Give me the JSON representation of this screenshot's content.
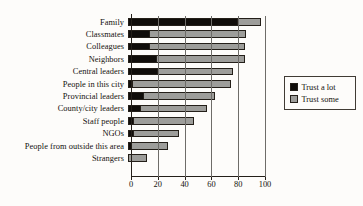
{
  "chart_data": {
    "type": "bar",
    "orientation": "horizontal",
    "stacked": true,
    "title": "",
    "xlabel": "",
    "ylabel": "",
    "xlim": [
      0,
      100
    ],
    "xticks": [
      0,
      20,
      40,
      60,
      80,
      100
    ],
    "grid": "vertical",
    "legend_position": "right",
    "categories": [
      "Family",
      "Classmates",
      "Colleagues",
      "Neighbors",
      "Central leaders",
      "People in this city",
      "Provincial leaders",
      "County/city leaders",
      "Staff people",
      "NGOs",
      "People from outside this area",
      "Strangers"
    ],
    "series": [
      {
        "name": "Trust a lot",
        "color": "#100d0a",
        "values": [
          81,
          16,
          16,
          21,
          22,
          3,
          11,
          9,
          4,
          4,
          2,
          0
        ]
      },
      {
        "name": "Trust some",
        "color": "#9d9d9a",
        "values": [
          18,
          72,
          71,
          66,
          56,
          74,
          54,
          50,
          45,
          34,
          28,
          14
        ]
      }
    ],
    "totals": [
      99,
      88,
      87,
      87,
      78,
      77,
      65,
      59,
      49,
      38,
      30,
      14
    ]
  },
  "legend": {
    "items": [
      {
        "label": "Trust a lot",
        "color": "#100d0a"
      },
      {
        "label": "Trust some",
        "color": "#9d9d9a"
      }
    ]
  }
}
